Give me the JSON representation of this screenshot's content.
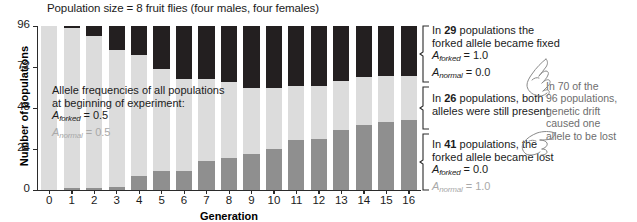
{
  "figure": {
    "title": "Population size = 8 fruit flies (four males, four females)",
    "xlabel": "Generation",
    "ylabel": "Number of populations"
  },
  "inplot_note": {
    "line1": "Allele frequencies of all populations",
    "line2": "at beginning of experiment:",
    "forked_symbol": "A",
    "forked_sub": "forked",
    "forked_value": "= 0.5",
    "normal_symbol": "A",
    "normal_sub": "normal",
    "normal_value": "= 0.5"
  },
  "annotations": {
    "fixed": {
      "text_pre": "In ",
      "count": "29",
      "text_post": " populations the",
      "line2": "forked allele became fixed",
      "forked_symbol": "A",
      "forked_sub": "forked",
      "forked_value": "= 1.0",
      "normal_symbol": "A",
      "normal_sub": "normal",
      "normal_value": "= 0.0"
    },
    "both": {
      "text_pre": "In ",
      "count": "26",
      "text_post": " populations, both",
      "line2": "alleles were still present"
    },
    "lost": {
      "text_pre": "In ",
      "count": "41",
      "text_post": " populations, the",
      "line2": "forked allele became lost",
      "forked_symbol": "A",
      "forked_sub": "forked",
      "forked_value": "= 0.0",
      "normal_symbol": "A",
      "normal_sub": "normal",
      "normal_value": "= 1.0"
    },
    "drift": {
      "line1": "In 70 of the",
      "line2": "96 populations,",
      "line3": "genetic drift",
      "line4": "caused one",
      "line5": "allele to be lost"
    }
  },
  "colors": {
    "fixed": "#231f20",
    "both": "#dcdcdc",
    "lost": "#8f8f8f",
    "axis": "#2b2b2b",
    "gray_text": "#a9a9a9",
    "drift_text": "#6e6e6e"
  },
  "chart_data": {
    "type": "bar",
    "title": "Population size = 8 fruit flies (four males, four females)",
    "xlabel": "Generation",
    "ylabel": "Number of populations",
    "stacked": true,
    "grid": false,
    "legend": "none",
    "ylim": [
      0,
      96
    ],
    "yticks": [
      0,
      24,
      48,
      72,
      96
    ],
    "categories": [
      "0",
      "1",
      "2",
      "3",
      "4",
      "5",
      "6",
      "7",
      "8",
      "9",
      "10",
      "11",
      "12",
      "13",
      "14",
      "15",
      "16"
    ],
    "series": [
      {
        "name": "Forked allele lost (A_forked = 0.0)",
        "color": "#8f8f8f",
        "stack_position": "bottom",
        "values": [
          0,
          1,
          1,
          2,
          8,
          11,
          11,
          17,
          19,
          21,
          24,
          29,
          30,
          35,
          38,
          40,
          41
        ]
      },
      {
        "name": "Both alleles still present",
        "color": "#dcdcdc",
        "stack_position": "middle",
        "values": [
          96,
          94,
          89,
          80,
          71,
          60,
          54,
          48,
          44,
          39,
          36,
          32,
          31,
          29,
          28,
          27,
          26
        ]
      },
      {
        "name": "Forked allele fixed (A_forked = 1.0)",
        "color": "#231f20",
        "stack_position": "top",
        "values": [
          0,
          1,
          6,
          14,
          17,
          25,
          31,
          31,
          33,
          36,
          36,
          35,
          35,
          32,
          30,
          29,
          29
        ]
      }
    ],
    "totals": [
      96,
      96,
      96,
      96,
      96,
      96,
      96,
      96,
      96,
      96,
      96,
      96,
      96,
      96,
      96,
      96,
      96
    ],
    "annotations": [
      "In 29 populations the forked allele became fixed",
      "In 26 populations, both alleles were still present",
      "In 41 populations, the forked allele became lost",
      "In 70 of the 96 populations, genetic drift caused one allele to be lost"
    ]
  }
}
